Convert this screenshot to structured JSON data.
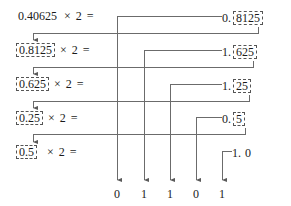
{
  "diagram": {
    "operator_symbol": "×",
    "multiplier": "2",
    "equals": "=",
    "rows": [
      {
        "operand": "0.40625",
        "operand_boxed": false,
        "expression": "× 2 =",
        "result_integer": "0.",
        "result_fraction": "8125",
        "result_fraction_boxed": true,
        "emitted_bit": "0"
      },
      {
        "operand": "0.8125",
        "operand_boxed": true,
        "expression": "× 2 =",
        "result_integer": "1.",
        "result_fraction": "625",
        "result_fraction_boxed": true,
        "emitted_bit": "1"
      },
      {
        "operand": "0.625",
        "operand_boxed": true,
        "expression": "× 2 =",
        "result_integer": "1.",
        "result_fraction": "25",
        "result_fraction_boxed": true,
        "emitted_bit": "1"
      },
      {
        "operand": "0.25",
        "operand_boxed": true,
        "expression": "× 2 =",
        "result_integer": "0.",
        "result_fraction": "5",
        "result_fraction_boxed": true,
        "emitted_bit": "0"
      },
      {
        "operand": "0.5",
        "operand_boxed": true,
        "expression": "× 2 =",
        "result_integer": "1.",
        "result_fraction": "0",
        "result_fraction_boxed": false,
        "emitted_bit": "1"
      }
    ],
    "binary_digits": [
      "0",
      "1",
      "1",
      "0",
      "1"
    ],
    "colors": {
      "ink": "#1a1a1a",
      "wire": "#6b6b6b",
      "dash": "#555555",
      "background": "#ffffff"
    }
  }
}
